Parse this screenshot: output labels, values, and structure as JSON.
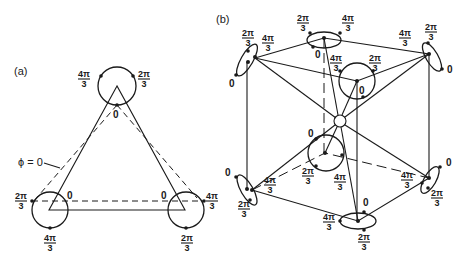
{
  "panel_a": {
    "label": "(a)",
    "phi_label": "ϕ = 0",
    "top": {
      "left": "4π/3",
      "right": "2π/3",
      "bottom": "0"
    },
    "bottom_left": {
      "left": "2π/3",
      "right": "0",
      "bottom": "4π/3"
    },
    "bottom_right": {
      "left": "0",
      "right": "4π/3",
      "bottom": "2π/3"
    }
  },
  "panel_b": {
    "label": "(b)",
    "phase_labels": {
      "zero": "0",
      "two_pi_3": "2π/3",
      "four_pi_3": "4π/3"
    }
  },
  "frac": {
    "two_num": "2π",
    "four_num": "4π",
    "den": "3",
    "zero": "0"
  }
}
